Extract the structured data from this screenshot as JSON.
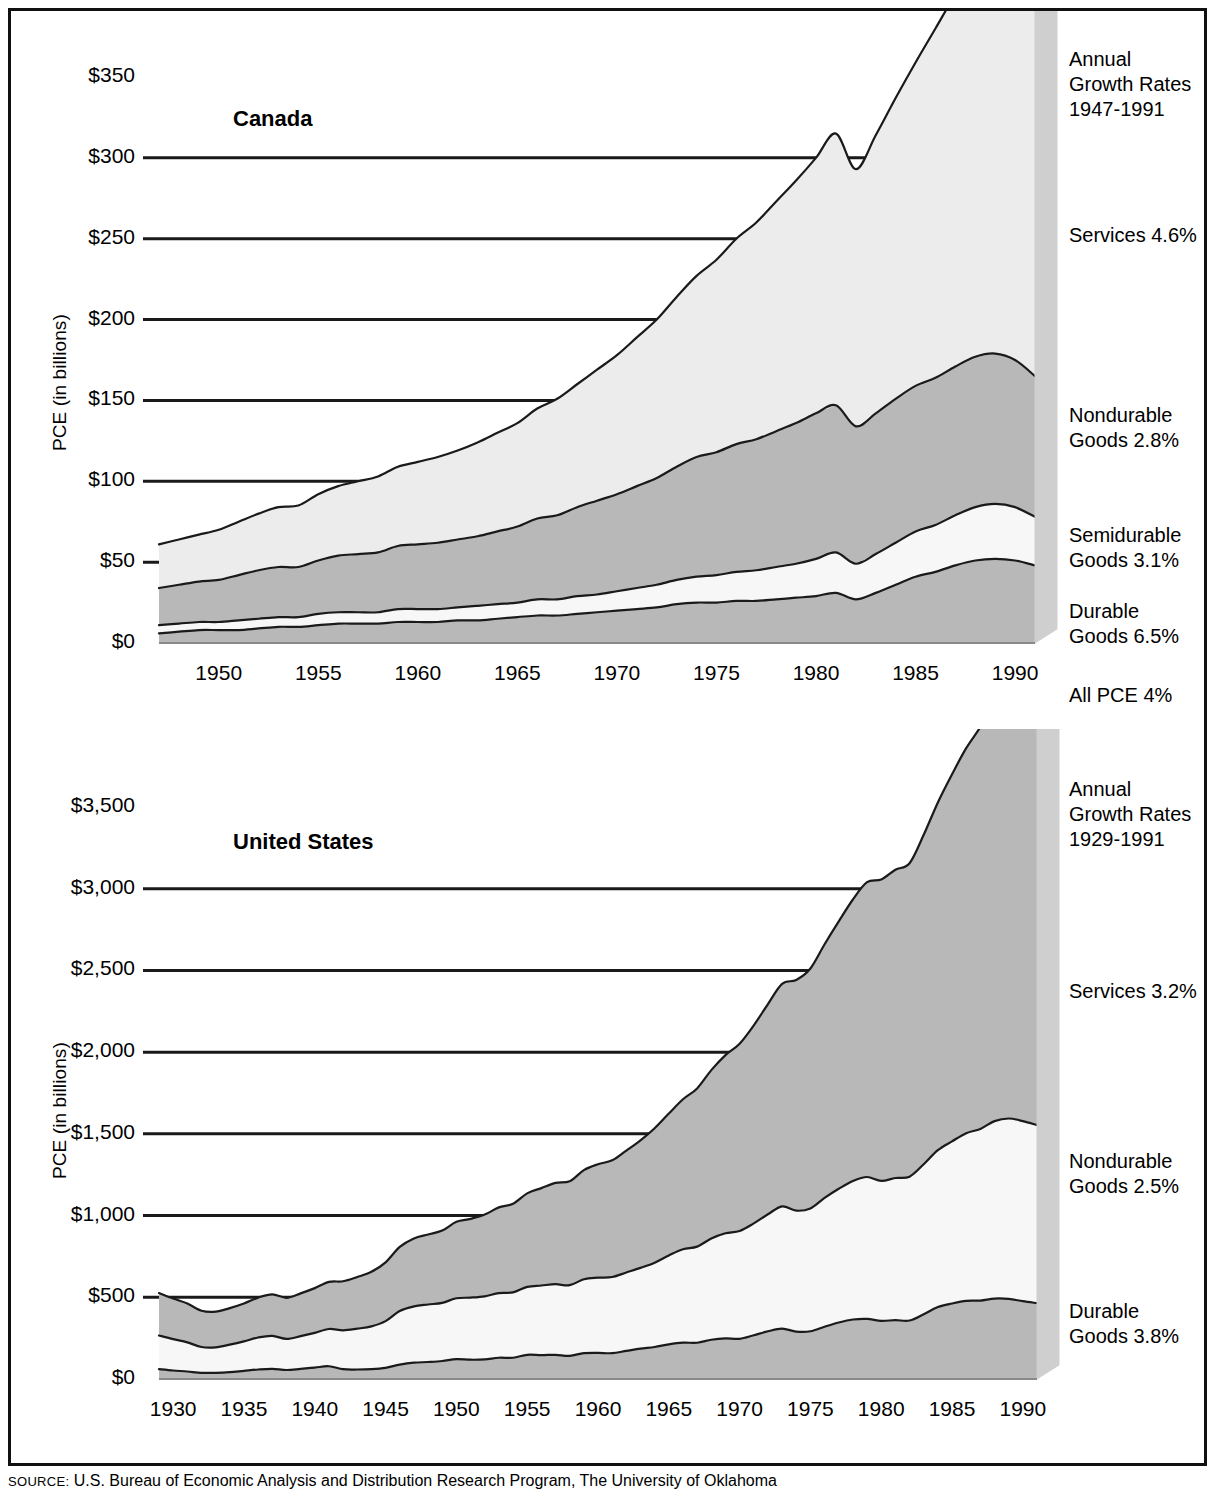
{
  "figure": {
    "source_prefix": "SOURCE:",
    "source_text": " U.S. Bureau of Economic Analysis and Distribution Research Program, The University of Oklahoma"
  },
  "colors": {
    "band_dark": "#b8b8b8",
    "band_light": "#ececec",
    "band_white": "#f7f7f7",
    "side_panel": "#cfcfcf",
    "outline": "#1a1a1a",
    "frame": "#111111"
  },
  "chart_data": [
    {
      "type": "area",
      "id": "canada",
      "title": "Canada",
      "ylabel": "PCE (in billions)",
      "xlabel": "",
      "ylim": [
        0,
        350
      ],
      "xlim": [
        1947,
        1991
      ],
      "grid": true,
      "yticks": [
        "$0",
        "$50",
        "$100",
        "$150",
        "$200",
        "$250",
        "$300",
        "$350"
      ],
      "ytick_values": [
        0,
        50,
        100,
        150,
        200,
        250,
        300,
        350
      ],
      "xticks": [
        "1950",
        "1955",
        "1960",
        "1965",
        "1970",
        "1975",
        "1980",
        "1985",
        "1990"
      ],
      "xtick_values": [
        1950,
        1955,
        1960,
        1965,
        1970,
        1975,
        1980,
        1985,
        1990
      ],
      "legend_title": "Annual\nGrowth Rates\n1947-1991",
      "legend_position": "right",
      "legend": [
        {
          "name": "Services 4.6%",
          "growth": 4.6
        },
        {
          "name": "Nondurable\nGoods 2.8%",
          "growth": 2.8
        },
        {
          "name": "Semidurable\nGoods 3.1%",
          "growth": 3.1
        },
        {
          "name": "Durable\nGoods 6.5%",
          "growth": 6.5
        },
        {
          "name": "All PCE 4%",
          "growth": 4.0
        }
      ],
      "x": [
        1947,
        1948,
        1949,
        1950,
        1951,
        1952,
        1953,
        1954,
        1955,
        1956,
        1957,
        1958,
        1959,
        1960,
        1961,
        1962,
        1963,
        1964,
        1965,
        1966,
        1967,
        1968,
        1969,
        1970,
        1971,
        1972,
        1973,
        1974,
        1975,
        1976,
        1977,
        1978,
        1979,
        1980,
        1981,
        1982,
        1983,
        1984,
        1985,
        1986,
        1987,
        1988,
        1989,
        1990,
        1991
      ],
      "stack_order_bottom_to_top": [
        "Durable Goods",
        "Semidurable Goods",
        "Nondurable Goods",
        "Services"
      ],
      "series": [
        {
          "name": "Durable Goods",
          "values": [
            6,
            7,
            8,
            8,
            8,
            9,
            10,
            10,
            11,
            12,
            12,
            12,
            13,
            13,
            13,
            14,
            14,
            15,
            16,
            17,
            17,
            18,
            19,
            20,
            21,
            22,
            24,
            25,
            25,
            26,
            26,
            27,
            28,
            29,
            31,
            27,
            31,
            36,
            41,
            44,
            48,
            51,
            52,
            51,
            48
          ]
        },
        {
          "name": "Semidurable Goods",
          "values": [
            5,
            5,
            5,
            5,
            6,
            6,
            6,
            6,
            7,
            7,
            7,
            7,
            8,
            8,
            8,
            8,
            9,
            9,
            9,
            10,
            10,
            11,
            11,
            12,
            13,
            14,
            15,
            16,
            17,
            18,
            19,
            20,
            21,
            23,
            25,
            22,
            24,
            26,
            28,
            29,
            31,
            33,
            34,
            33,
            30
          ]
        },
        {
          "name": "Nondurable Goods",
          "values": [
            23,
            24,
            25,
            26,
            28,
            30,
            31,
            31,
            33,
            35,
            36,
            37,
            39,
            40,
            41,
            42,
            43,
            45,
            47,
            50,
            52,
            55,
            58,
            60,
            63,
            66,
            70,
            74,
            76,
            79,
            81,
            84,
            87,
            90,
            91,
            85,
            87,
            89,
            90,
            91,
            92,
            93,
            93,
            91,
            87
          ]
        },
        {
          "name": "Services",
          "values": [
            27,
            28,
            29,
            31,
            33,
            35,
            37,
            38,
            41,
            43,
            45,
            47,
            49,
            51,
            53,
            55,
            58,
            61,
            64,
            68,
            72,
            76,
            81,
            86,
            92,
            98,
            105,
            112,
            119,
            127,
            134,
            142,
            150,
            158,
            168,
            159,
            172,
            186,
            200,
            216,
            230,
            242,
            248,
            250,
            243
          ]
        }
      ],
      "totals_note": "Bands are stacked; top of Services equals All PCE."
    },
    {
      "type": "area",
      "id": "united-states",
      "title": "United States",
      "ylabel": "PCE (in billions)",
      "xlabel": "",
      "ylim": [
        0,
        3500
      ],
      "xlim": [
        1929,
        1991
      ],
      "grid": true,
      "yticks": [
        "$0",
        "$500",
        "$1,000",
        "$1,500",
        "$2,000",
        "$2,500",
        "$3,000",
        "$3,500"
      ],
      "ytick_values": [
        0,
        500,
        1000,
        1500,
        2000,
        2500,
        3000,
        3500
      ],
      "xticks": [
        "1930",
        "1935",
        "1940",
        "1945",
        "1950",
        "1955",
        "1960",
        "1965",
        "1970",
        "1975",
        "1980",
        "1985",
        "1990"
      ],
      "xtick_values": [
        1930,
        1935,
        1940,
        1945,
        1950,
        1955,
        1960,
        1965,
        1970,
        1975,
        1980,
        1985,
        1990
      ],
      "legend_title": "Annual\nGrowth Rates\n1929-1991",
      "legend_position": "right",
      "legend": [
        {
          "name": "Services 3.2%",
          "growth": 3.2
        },
        {
          "name": "Nondurable\nGoods 2.5%",
          "growth": 2.5
        },
        {
          "name": "Durable\nGoods 3.8%",
          "growth": 3.8
        }
      ],
      "x": [
        1929,
        1930,
        1931,
        1932,
        1933,
        1934,
        1935,
        1936,
        1937,
        1938,
        1939,
        1940,
        1941,
        1942,
        1943,
        1944,
        1945,
        1946,
        1947,
        1948,
        1949,
        1950,
        1951,
        1952,
        1953,
        1954,
        1955,
        1956,
        1957,
        1958,
        1959,
        1960,
        1961,
        1962,
        1963,
        1964,
        1965,
        1966,
        1967,
        1968,
        1969,
        1970,
        1971,
        1972,
        1973,
        1974,
        1975,
        1976,
        1977,
        1978,
        1979,
        1980,
        1981,
        1982,
        1983,
        1984,
        1985,
        1986,
        1987,
        1988,
        1989,
        1990,
        1991
      ],
      "stack_order_bottom_to_top": [
        "Durable Goods",
        "Nondurable Goods",
        "Services"
      ],
      "series": [
        {
          "name": "Durable Goods",
          "values": [
            60,
            52,
            46,
            38,
            38,
            42,
            50,
            58,
            62,
            55,
            62,
            70,
            78,
            60,
            58,
            60,
            68,
            88,
            100,
            104,
            110,
            122,
            118,
            120,
            130,
            130,
            148,
            146,
            148,
            142,
            158,
            160,
            158,
            172,
            186,
            196,
            212,
            222,
            222,
            240,
            248,
            246,
            268,
            292,
            308,
            290,
            292,
            320,
            346,
            364,
            368,
            356,
            360,
            358,
            396,
            440,
            462,
            478,
            480,
            492,
            490,
            476,
            464
          ]
        },
        {
          "name": "Nondurable Goods",
          "values": [
            206,
            192,
            178,
            158,
            156,
            168,
            180,
            196,
            202,
            190,
            200,
            212,
            228,
            238,
            250,
            262,
            286,
            328,
            344,
            352,
            356,
            372,
            380,
            386,
            396,
            400,
            416,
            426,
            432,
            432,
            452,
            460,
            466,
            480,
            494,
            516,
            544,
            572,
            588,
            620,
            644,
            660,
            684,
            716,
            748,
            740,
            752,
            788,
            818,
            848,
            868,
            856,
            870,
            880,
            918,
            960,
            992,
            1026,
            1050,
            1086,
            1104,
            1102,
            1090
          ]
        },
        {
          "name": "Services",
          "values": [
            260,
            248,
            238,
            222,
            218,
            224,
            232,
            244,
            254,
            252,
            262,
            274,
            288,
            300,
            316,
            334,
            360,
            392,
            416,
            428,
            442,
            468,
            482,
            500,
            524,
            542,
            572,
            596,
            620,
            636,
            668,
            694,
            714,
            746,
            780,
            822,
            868,
            918,
            968,
            1030,
            1090,
            1146,
            1212,
            1286,
            1362,
            1412,
            1468,
            1552,
            1636,
            1722,
            1804,
            1844,
            1886,
            1918,
            2016,
            2128,
            2246,
            2356,
            2460,
            2572,
            2660,
            2708,
            2740
          ]
        }
      ],
      "totals_note": "Bands are stacked; top of Services equals All PCE."
    }
  ]
}
